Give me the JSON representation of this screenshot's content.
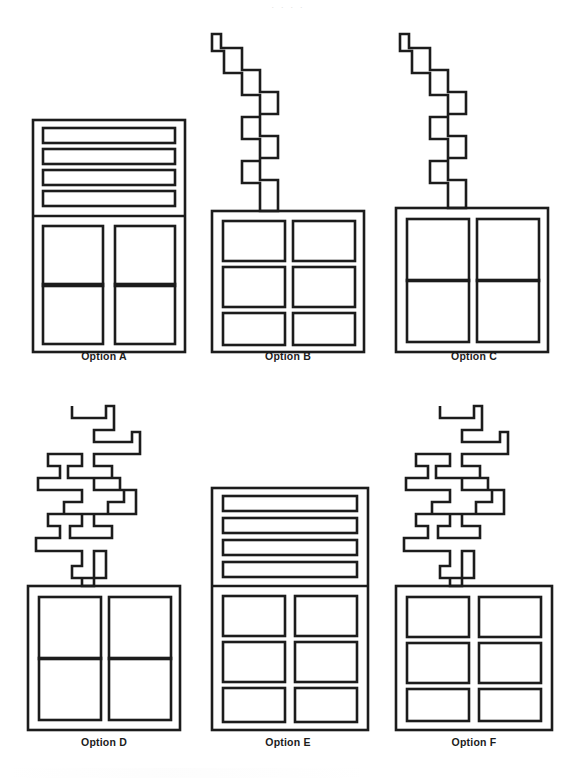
{
  "page": {
    "background_color": "#ffffff",
    "ink_color": "#1c1c1c",
    "width": 576,
    "height": 778,
    "top_edge_artifact": "· ·        ·        ·"
  },
  "figures": [
    {
      "id": "a",
      "label": "Option A",
      "has_zigzag": false,
      "zigzag_style": "none",
      "top_section": "four-horizontal-bars",
      "top_bar_count": 4,
      "grid_rows": 2,
      "grid_cols": 2,
      "grid_cell_shape": "square"
    },
    {
      "id": "b",
      "label": "Option B",
      "has_zigzag": true,
      "zigzag_style": "simple-staircase",
      "top_section": "none",
      "top_bar_count": 0,
      "grid_rows": 3,
      "grid_cols": 2,
      "grid_cell_shape": "wide-rectangle"
    },
    {
      "id": "c",
      "label": "Option C",
      "has_zigzag": true,
      "zigzag_style": "simple-staircase",
      "top_section": "none",
      "top_bar_count": 0,
      "grid_rows": 2,
      "grid_cols": 2,
      "grid_cell_shape": "square"
    },
    {
      "id": "d",
      "label": "Option D",
      "has_zigzag": true,
      "zigzag_style": "branching-staircase",
      "top_section": "none",
      "top_bar_count": 0,
      "grid_rows": 2,
      "grid_cols": 2,
      "grid_cell_shape": "square"
    },
    {
      "id": "e",
      "label": "Option E",
      "has_zigzag": false,
      "zigzag_style": "none",
      "top_section": "four-horizontal-bars",
      "top_bar_count": 4,
      "grid_rows": 3,
      "grid_cols": 2,
      "grid_cell_shape": "wide-rectangle"
    },
    {
      "id": "f",
      "label": "Option F",
      "has_zigzag": true,
      "zigzag_style": "branching-staircase",
      "top_section": "none",
      "top_bar_count": 0,
      "grid_rows": 3,
      "grid_cols": 2,
      "grid_cell_shape": "wide-rectangle"
    }
  ]
}
